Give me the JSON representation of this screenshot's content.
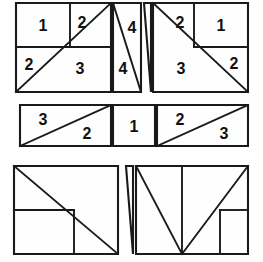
{
  "figure": {
    "canvas": {
      "width": 263,
      "height": 262
    },
    "colors": {
      "background": "#ffffff",
      "piece_fill": "#fefefe",
      "stroke": "#1a1a1a",
      "label": "#111111"
    },
    "bands": [
      {
        "name": "top-band",
        "bounds": {
          "x": 16,
          "y": 3,
          "width": 232,
          "height": 89
        },
        "pieces": [
          {
            "name": "top-left-piece",
            "outline": "16,3 111,3 111,92 16,92",
            "cuts": [
              "M16,47 L111,47",
              "M70,3 L70,47",
              "M16,92 L111,3"
            ],
            "labels": [
              {
                "text": "1",
                "x": 43,
                "y": 25
              },
              {
                "text": "2",
                "x": 82,
                "y": 22
              },
              {
                "text": "2",
                "x": 29,
                "y": 64
              },
              {
                "text": "3",
                "x": 80,
                "y": 68
              }
            ]
          },
          {
            "name": "top-middle-left-sliver",
            "outline": "113,3 141,3 141,92 113,92",
            "cuts": [
              "M113,3 L141,92"
            ],
            "labels": [
              {
                "text": "4",
                "x": 123,
                "y": 68
              },
              {
                "text": "4",
                "x": 132,
                "y": 27
              }
            ]
          },
          {
            "name": "top-middle-right-sliver",
            "outline": "144,3 151,3 151,92",
            "cuts": [],
            "labels": []
          },
          {
            "name": "top-right-piece",
            "outline": "153,3 248,3 248,92 153,92",
            "cuts": [
              "M194,3 L194,47",
              "M194,47 L248,47",
              "M153,3 L248,92"
            ],
            "labels": [
              {
                "text": "2",
                "x": 180,
                "y": 22
              },
              {
                "text": "1",
                "x": 221,
                "y": 25
              },
              {
                "text": "3",
                "x": 181,
                "y": 68
              },
              {
                "text": "2",
                "x": 234,
                "y": 63
              }
            ]
          }
        ]
      },
      {
        "name": "middle-band",
        "bounds": {
          "x": 20,
          "y": 105,
          "width": 228,
          "height": 41
        },
        "pieces": [
          {
            "name": "middle-left-piece",
            "outline": "20,105 111,105 111,146 20,146",
            "cuts": [
              "M20,146 L111,105"
            ],
            "labels": [
              {
                "text": "3",
                "x": 43,
                "y": 119
              },
              {
                "text": "2",
                "x": 87,
                "y": 133
              }
            ]
          },
          {
            "name": "middle-center-piece",
            "outline": "113,105 155,105 155,146 113,146",
            "cuts": [],
            "labels": [
              {
                "text": "1",
                "x": 134,
                "y": 126
              }
            ]
          },
          {
            "name": "middle-right-piece",
            "outline": "157,105 248,105 248,146 157,146",
            "cuts": [
              "M157,146 L248,105"
            ],
            "labels": [
              {
                "text": "2",
                "x": 180,
                "y": 119
              },
              {
                "text": "3",
                "x": 224,
                "y": 133
              }
            ]
          }
        ]
      },
      {
        "name": "bottom-band",
        "bounds": {
          "x": 14,
          "y": 166,
          "width": 234,
          "height": 88
        },
        "pieces": [
          {
            "name": "bottom-left-piece",
            "outline": "14,166 118,166 118,254 14,254",
            "cuts": [
              "M14,210 L74,210",
              "M74,210 L74,254",
              "M14,166 L118,254"
            ],
            "labels": []
          },
          {
            "name": "bottom-middle-sliver",
            "outline": "126,166 133,166 133,254",
            "cuts": [],
            "labels": []
          },
          {
            "name": "bottom-right-piece",
            "outline": "136,166 248,166 248,254 136,254",
            "cuts": [
              "M136,166 L182,254",
              "M182,166 L182,254",
              "M182,254 L248,166",
              "M220,210 L248,210",
              "M220,210 L220,254"
            ],
            "labels": []
          }
        ]
      }
    ]
  }
}
